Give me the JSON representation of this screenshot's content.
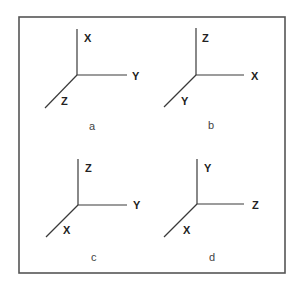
{
  "diagram": {
    "colors": {
      "frame": "#555555",
      "axis": "#3a3a3a",
      "label": "#222222",
      "caption": "#444444"
    },
    "frame": {
      "x": 19,
      "y": 17,
      "width": 266,
      "height": 256
    },
    "panels": [
      {
        "caption": "a",
        "origin": [
          77,
          75
        ],
        "up_end": [
          77,
          29
        ],
        "right_end": [
          127,
          75
        ],
        "diag_end": [
          45,
          108
        ],
        "labels": {
          "up": "X",
          "right": "Y",
          "diag": "Z"
        },
        "label_pos": {
          "up": [
            84,
            42
          ],
          "right": [
            132,
            80
          ],
          "diag": [
            61,
            105
          ]
        },
        "caption_pos": [
          89,
          130
        ]
      },
      {
        "caption": "b",
        "origin": [
          196,
          75
        ],
        "up_end": [
          196,
          28
        ],
        "right_end": [
          244,
          75
        ],
        "diag_end": [
          164,
          107
        ],
        "labels": {
          "up": "Z",
          "right": "X",
          "diag": "Y"
        },
        "label_pos": {
          "up": [
            202,
            42
          ],
          "right": [
            251,
            80
          ],
          "diag": [
            181,
            105
          ]
        },
        "caption_pos": [
          208,
          129
        ]
      },
      {
        "caption": "c",
        "origin": [
          78,
          205
        ],
        "up_end": [
          78,
          159
        ],
        "right_end": [
          127,
          205
        ],
        "diag_end": [
          46,
          237
        ],
        "labels": {
          "up": "Z",
          "right": "Y",
          "diag": "X"
        },
        "label_pos": {
          "up": [
            85,
            172
          ],
          "right": [
            133,
            209
          ],
          "diag": [
            63,
            234
          ]
        },
        "caption_pos": [
          91,
          261
        ]
      },
      {
        "caption": "d",
        "origin": [
          197,
          204
        ],
        "up_end": [
          197,
          159
        ],
        "right_end": [
          244,
          204
        ],
        "diag_end": [
          164,
          237
        ],
        "labels": {
          "up": "Y",
          "right": "Z",
          "diag": "X"
        },
        "label_pos": {
          "up": [
            204,
            172
          ],
          "right": [
            252,
            209
          ],
          "diag": [
            183,
            234
          ]
        },
        "caption_pos": [
          209,
          261
        ]
      }
    ]
  }
}
